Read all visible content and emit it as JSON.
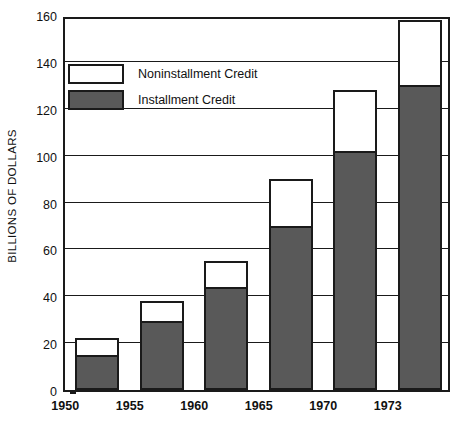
{
  "chart_data": {
    "type": "bar",
    "stacked": true,
    "title": "",
    "subtitle": "",
    "xlabel": "",
    "ylabel": "BILLIONS OF DOLLARS",
    "categories": [
      "1950",
      "1955",
      "1960",
      "1965",
      "1970",
      "1973"
    ],
    "ylim": [
      0,
      160
    ],
    "yticks": [
      0,
      20,
      40,
      60,
      80,
      100,
      120,
      140,
      160
    ],
    "ytick_labels": [
      "0",
      "20",
      "40",
      "60",
      "80",
      "100",
      "120",
      "140",
      "160"
    ],
    "grid": true,
    "grid_axis": "y",
    "legend_position": "top-left-inside",
    "series": [
      {
        "name": "Installment Credit",
        "color": "#595959",
        "values": [
          15,
          29.5,
          44,
          70,
          102,
          130
        ]
      },
      {
        "name": "Noninstallment Credit",
        "color": "#ffffff",
        "values": [
          7,
          8.5,
          11,
          20,
          26,
          28
        ]
      }
    ],
    "totals": [
      22,
      38,
      55,
      90,
      128,
      158
    ],
    "annotations": []
  },
  "legend": {
    "items": [
      {
        "label": "Noninstallment Credit",
        "swatch": "noninstallment"
      },
      {
        "label": "Installment Credit",
        "swatch": "installment"
      }
    ]
  },
  "colors": {
    "installment": "#595959",
    "noninstallment": "#ffffff",
    "axis": "#1a1a1a",
    "text": "#111111",
    "background": "#ffffff"
  }
}
